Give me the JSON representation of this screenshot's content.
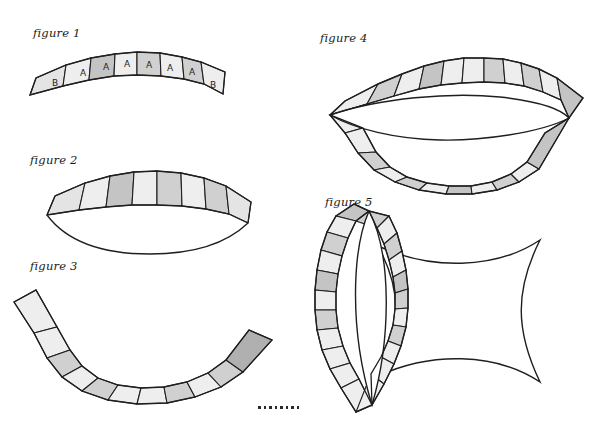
{
  "page": {
    "background_color": "#ffffff",
    "width": 599,
    "height": 421,
    "stroke_color": "#1f1f1f"
  },
  "palette": {
    "light": "#eeeeee",
    "light2": "#e4e4e4",
    "mid": "#d0d0d0",
    "mid2": "#c4c4c4",
    "dark": "#b0b0b0",
    "white": "#ffffff",
    "outline": "#1f1f1f"
  },
  "figures": [
    {
      "id": "figure-1",
      "label": "figure 1",
      "label_x": 33,
      "label_y": 33,
      "description": "shallow arc band of nine trapezoid segments",
      "segment_count": 9,
      "segment_letters": [
        "B",
        "A",
        "A",
        "A",
        "A",
        "A",
        "A",
        "B"
      ],
      "shades": [
        "light2",
        "light",
        "mid2",
        "light",
        "mid",
        "light",
        "mid",
        "light"
      ]
    },
    {
      "id": "figure-2",
      "label": "figure 2",
      "label_x": 30,
      "label_y": 160,
      "description": "crescent of eight segments over a curved base",
      "segment_count": 8,
      "shades": [
        "light2",
        "light",
        "mid2",
        "light",
        "mid",
        "light",
        "mid",
        "light2"
      ]
    },
    {
      "id": "figure-3",
      "label": "figure 3",
      "label_x": 30,
      "label_y": 266,
      "description": "upward opening arc band of nine segments",
      "segment_count": 9,
      "shades": [
        "light",
        "light",
        "mid",
        "light",
        "mid",
        "light",
        "mid",
        "light",
        "dark"
      ]
    },
    {
      "id": "figure-4",
      "label": "figure 4",
      "label_x": 320,
      "label_y": 38,
      "description": "lens shaped ring of segments around a white lens hole",
      "segment_count_top": 11,
      "segment_count_bottom": 11,
      "shades_top": [
        "light",
        "mid",
        "light",
        "mid2",
        "light",
        "light",
        "mid",
        "light",
        "mid",
        "light",
        "mid2"
      ],
      "shades_bottom": [
        "light",
        "light",
        "mid",
        "light",
        "mid",
        "light",
        "mid2",
        "light",
        "mid",
        "light",
        "mid2"
      ]
    },
    {
      "id": "figure-5",
      "label": "figure 5",
      "label_x": 325,
      "label_y": 202,
      "description": "vertical lens ring of segments beside a concave square",
      "segment_count_left": 11,
      "segment_count_right": 11,
      "inner_label": "large square",
      "inner_label_x": 430,
      "inner_label_y": 297,
      "shades_left": [
        "mid2",
        "light",
        "mid",
        "light",
        "mid2",
        "light",
        "mid",
        "light",
        "light",
        "light",
        "light"
      ],
      "shades_right": [
        "mid",
        "light",
        "mid",
        "light",
        "mid2",
        "mid",
        "light",
        "mid",
        "light",
        "light",
        "light"
      ]
    }
  ],
  "ellipsis": {
    "name": "continuation-dots",
    "dot_count": 8,
    "x": 258,
    "y": 406
  }
}
